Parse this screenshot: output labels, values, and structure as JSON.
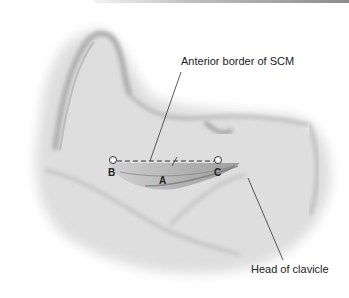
{
  "figure": {
    "labels": {
      "anterior_border": "Anterior border of SCM",
      "head_of_clavicle": "Head of clavicle"
    },
    "points": {
      "a": "A",
      "b": "B",
      "c": "C"
    },
    "colors": {
      "ink": "#222222",
      "skin_shadow": "#9a9a9a",
      "muscle": "#7a7a7a"
    }
  }
}
